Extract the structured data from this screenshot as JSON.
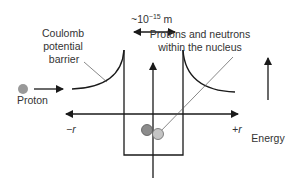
{
  "diagram": {
    "labels": {
      "barrier_line1": "Coulomb",
      "barrier_line2": "potential",
      "barrier_line3": "barrier",
      "scale_prefix": "~10",
      "scale_exponent": "−15",
      "scale_unit": " m",
      "nucleus_line1": "Protons and neutrons",
      "nucleus_line2": "within the nucleus",
      "proton": "Proton",
      "neg_r": "−r",
      "pos_r": "+r",
      "energy": "Energy"
    },
    "colors": {
      "line": "#1a1a1a",
      "proton_fill": "#999999",
      "nucleon_dark": "#8c8c8c",
      "nucleon_light": "#c4c4c4",
      "text": "#333333"
    },
    "icons": {
      "proton": "gray-circle",
      "incoming_arrow": "right-arrow",
      "energy_arrow": "up-arrow",
      "scale_arrow": "double-headed-arrow"
    }
  }
}
